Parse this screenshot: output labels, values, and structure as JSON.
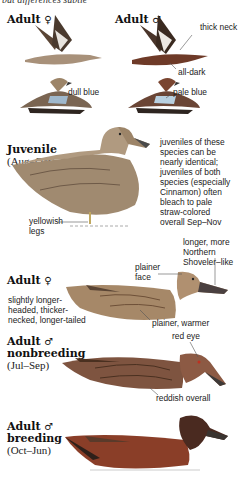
{
  "header": {
    "clipped_text": "but differences subtle"
  },
  "sections": [
    {
      "id": "adult-female-flight",
      "title": "Adult",
      "sex_symbol": "♀",
      "callouts": [
        "dull blue"
      ]
    },
    {
      "id": "adult-male-flight",
      "title": "Adult",
      "sex_symbol": "♂",
      "callouts": [
        "thick neck",
        "all-dark",
        "pale blue"
      ]
    },
    {
      "id": "juvenile",
      "title": "Juvenile",
      "subtitle": "(Aug–Oct)",
      "callouts": [
        "yellowish legs"
      ],
      "note": [
        "juveniles of these",
        "species can be",
        "nearly identical;",
        "juveniles of both",
        "species (especially",
        "Cinnamon) often",
        "bleach to pale",
        "straw-colored",
        "overall Sep–Nov"
      ]
    },
    {
      "id": "adult-female",
      "title": "Adult",
      "sex_symbol": "♀",
      "callouts": [
        "plainer face",
        "plainer, warmer"
      ],
      "bill_note": [
        "longer, more",
        "Northern",
        "Shoveler–like"
      ],
      "note": [
        "slightly longer-",
        "headed, thicker-",
        "necked, longer-tailed"
      ]
    },
    {
      "id": "adult-male-nonbreeding",
      "title": "Adult",
      "sex_symbol": "♂",
      "title2": "nonbreeding",
      "subtitle": "(Jul–Sep)",
      "callouts": [
        "red eye",
        "reddish overall"
      ]
    },
    {
      "id": "adult-male-breeding",
      "title": "Adult",
      "sex_symbol": "♂",
      "title2": "breeding",
      "subtitle": "(Oct–Jun)"
    }
  ],
  "colors": {
    "female": "#a08060",
    "male": "#8a4a30",
    "blue": "#9fb8cc",
    "dark": "#3a2a20"
  }
}
